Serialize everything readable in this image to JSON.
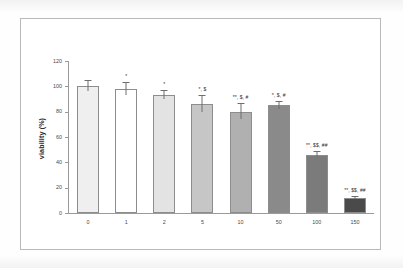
{
  "chart_data": {
    "type": "bar",
    "title": "",
    "subtitle": "",
    "xlabel": "",
    "ylabel": "viability (%)",
    "categories": [
      "0",
      "1",
      "2",
      "5",
      "10",
      "50",
      "100",
      "150"
    ],
    "values": [
      100,
      98,
      93,
      86,
      80,
      85,
      46,
      12
    ],
    "errors": [
      4,
      5,
      3,
      6,
      6,
      3,
      2,
      1
    ],
    "annotations": [
      "",
      "*",
      "*",
      "*, $",
      "**, $, #",
      "*, $, #",
      "**, $$, ##",
      "**, $$, ##"
    ],
    "bar_colors": [
      "#efefef",
      "#ffffff",
      "#e3e3e3",
      "#c6c6c6",
      "#b0b0b0",
      "#8a8a8a",
      "#7b7b7b",
      "#4a4a4a"
    ],
    "bar_border_color": "#8d8d8d",
    "error_bar_color": "#6e6e6e",
    "axis_color": "#9a9a9a",
    "ylim": [
      0,
      120
    ],
    "yticks": [
      0,
      20,
      40,
      60,
      80,
      100,
      120
    ],
    "ytick_labels": [
      "0",
      "20",
      "40",
      "60",
      "80",
      "100",
      "120"
    ],
    "grid": false,
    "legend": "none"
  }
}
